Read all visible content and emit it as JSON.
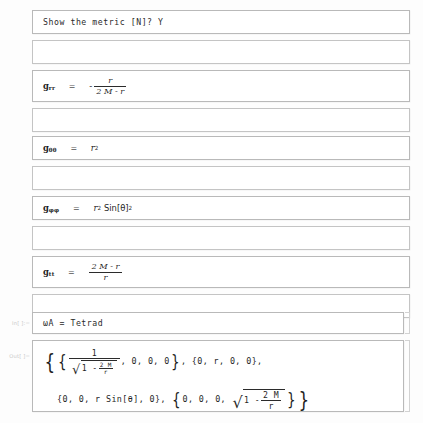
{
  "app": "Mathematica Notebook",
  "document": {
    "title": "Schwarzschild metric and tetrad output"
  },
  "cells": [
    {
      "id": "prompt-show-metric",
      "kind": "text",
      "label": "",
      "text": "Show the metric [N]? Y",
      "top": 10,
      "height": 24
    },
    {
      "id": "spacer-1",
      "kind": "empty",
      "label": "",
      "top": 40,
      "height": 24
    },
    {
      "id": "metric-grr",
      "kind": "math",
      "label": "",
      "symbol": "g",
      "subscript": "rr",
      "equals": "=",
      "top": 70,
      "height": 32,
      "expression": "-r/(2M-r)",
      "sign": "-",
      "numerator": "r",
      "denominator": "2 M - r"
    },
    {
      "id": "spacer-2",
      "kind": "empty",
      "label": "",
      "top": 108,
      "height": 24
    },
    {
      "id": "metric-gthetatheta",
      "kind": "math",
      "label": "",
      "symbol": "g",
      "subscript": "θθ",
      "equals": "=",
      "top": 136,
      "height": 24,
      "expression": "r^2",
      "base": "r",
      "power": "2"
    },
    {
      "id": "spacer-3",
      "kind": "empty",
      "label": "",
      "top": 166,
      "height": 24
    },
    {
      "id": "metric-gphiphi",
      "kind": "math",
      "label": "",
      "symbol": "g",
      "subscript": "φφ",
      "equals": "=",
      "top": 196,
      "height": 24,
      "expression": "r^2 Sin[θ]^2",
      "base": "r",
      "power": "2",
      "trig": "Sin[θ]",
      "trig_power": "2"
    },
    {
      "id": "spacer-4",
      "kind": "empty",
      "label": "",
      "top": 226,
      "height": 24
    },
    {
      "id": "metric-gtt",
      "kind": "math",
      "label": "",
      "symbol": "g",
      "subscript": "tt",
      "equals": "=",
      "top": 256,
      "height": 32,
      "expression": "(2M-r)/r",
      "numerator": "2 M - r",
      "denominator": "r"
    },
    {
      "id": "spacer-5",
      "kind": "empty",
      "label": "",
      "top": 294,
      "height": 24
    }
  ],
  "input_cell": {
    "id": "input-tetrad",
    "label": "In[ ]:=",
    "text": "ωA = Tetrad",
    "top": 312,
    "height": 22
  },
  "output_cell": {
    "id": "output-tetrad",
    "label": "Out[ ]=",
    "top": 340,
    "height": 72,
    "expression": "{{1/Sqrt[1-2M/r], 0, 0, 0}, {0, r, 0, 0}, {0, 0, r Sin[θ], 0}, {0, 0, 0, Sqrt[1-2M/r]}}",
    "line1": {
      "open_outer": "{",
      "open_inner": "{",
      "frac_num": "1",
      "sqrt_one": "1 -",
      "sqrt_frac_num": "2 M",
      "sqrt_frac_den": "r",
      "rest": ", 0, 0, 0",
      "close_inner": "}",
      "comma": ", ",
      "vec2": "{0, r, 0, 0},"
    },
    "line2": {
      "vec3": "{0, 0, r Sin[θ], 0}, ",
      "open_inner": "{",
      "vec4_head": "0, 0, 0, ",
      "sqrt_one": "1 -",
      "sqrt_frac_num": "2 M",
      "sqrt_frac_den": "r",
      "close_inner": "}",
      "close_outer": "}"
    }
  },
  "colors": {
    "page_background": "#fdfdfd",
    "cell_background": "#ffffff",
    "cell_border": "#b9b9b9",
    "text": "#2b2b2b",
    "label_text": "#c9c9c9"
  }
}
